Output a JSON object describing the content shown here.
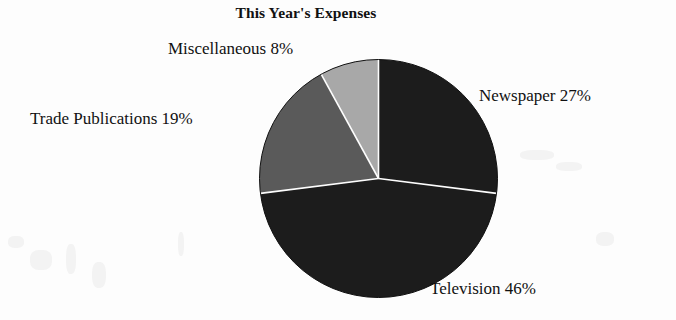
{
  "chart_data": {
    "type": "pie",
    "title": "This Year's Expenses",
    "xlabel": "",
    "ylabel": "",
    "legend_position": "none",
    "grid": false,
    "start_angle_deg": 0,
    "direction": "clockwise",
    "categories": [
      "Newspaper",
      "Television",
      "Trade Publications",
      "Miscellaneous"
    ],
    "values": [
      27,
      46,
      19,
      8
    ],
    "value_unit": "%",
    "total": 100,
    "slices": [
      {
        "label": "Newspaper",
        "value": 27,
        "value_text": "27%",
        "annotation": "Newspaper 27%",
        "color": "#1c1c1c"
      },
      {
        "label": "Television",
        "value": 46,
        "value_text": "46%",
        "annotation": "Television 46%",
        "color": "#1c1c1c"
      },
      {
        "label": "Trade Publications",
        "value": 19,
        "value_text": "19%",
        "annotation": "Trade Publications 19%",
        "color": "#5a5a5a"
      },
      {
        "label": "Miscellaneous",
        "value": 8,
        "value_text": "8%",
        "annotation": "Miscellaneous 8%",
        "color": "#a8a8a8"
      }
    ],
    "separator_color": "#fdfdfd",
    "background_color": "#fdfdfd"
  },
  "labels": {
    "miscellaneous": "Miscellaneous 8%",
    "trade_publications": "Trade Publications 19%",
    "newspaper": "Newspaper 27%",
    "television": "Television 46%"
  }
}
